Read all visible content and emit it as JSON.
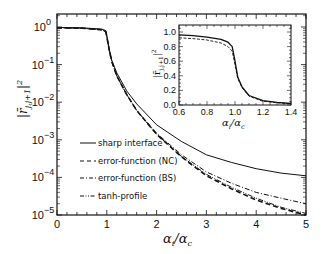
{
  "chart_data": [
    {
      "type": "line",
      "title": "",
      "xlabel": "αi/αc",
      "ylabel": "|r̄ j,j+1|²",
      "xscale": "linear",
      "yscale": "log",
      "xlim": [
        0,
        5
      ],
      "ylim": [
        1e-05,
        2
      ],
      "xticks": [
        "0",
        "1",
        "2",
        "3",
        "4",
        "5"
      ],
      "yticks": [
        "10^0",
        "10^-1",
        "10^-2",
        "10^-3",
        "10^-4",
        "10^-5"
      ],
      "grid": false,
      "legend_position": "lower left (inside)",
      "x": [
        0,
        0.5,
        0.9,
        0.98,
        1.0,
        1.05,
        1.1,
        1.2,
        1.4,
        1.6,
        2.0,
        2.5,
        3.0,
        3.5,
        4.0,
        4.5,
        5.0
      ],
      "series": [
        {
          "name": "sharp interface",
          "style": "solid",
          "values": [
            0.97,
            0.95,
            0.88,
            0.8,
            0.6,
            0.25,
            0.13,
            0.06,
            0.02,
            0.009,
            0.0025,
            0.0009,
            0.0004,
            0.00025,
            0.00017,
            0.00013,
            0.00011
          ]
        },
        {
          "name": "error-function (NC)",
          "style": "dashed",
          "values": [
            0.95,
            0.93,
            0.84,
            0.75,
            0.55,
            0.24,
            0.12,
            0.05,
            0.016,
            0.006,
            0.0014,
            0.00035,
            0.00011,
            5e-05,
            2.5e-05,
            1.5e-05,
            1e-05
          ]
        },
        {
          "name": "error-function (BS)",
          "style": "dash-dot",
          "values": [
            0.95,
            0.93,
            0.84,
            0.75,
            0.55,
            0.24,
            0.12,
            0.05,
            0.016,
            0.006,
            0.0015,
            0.0004,
            0.00014,
            7e-05,
            4e-05,
            2.8e-05,
            2e-05
          ]
        },
        {
          "name": "tanh-profile",
          "style": "dash-dot-dot",
          "values": [
            0.95,
            0.93,
            0.84,
            0.75,
            0.55,
            0.24,
            0.12,
            0.05,
            0.016,
            0.006,
            0.0014,
            0.00036,
            0.00012,
            5.5e-05,
            2.8e-05,
            1.6e-05,
            1.1e-05
          ]
        }
      ]
    },
    {
      "type": "line",
      "title": "inset",
      "xlabel": "αi/αc",
      "ylabel": "|r̄ j,j+1|²",
      "xscale": "linear",
      "yscale": "linear",
      "xlim": [
        0.6,
        1.4
      ],
      "ylim": [
        0.0,
        1.05
      ],
      "xticks": [
        "0.6",
        "0.8",
        "1.0",
        "1.2",
        "1.4"
      ],
      "yticks": [
        "0.0",
        "0.2",
        "0.4",
        "0.6",
        "0.8",
        "1.0"
      ],
      "x": [
        0.6,
        0.7,
        0.8,
        0.9,
        0.95,
        0.98,
        1.0,
        1.02,
        1.05,
        1.1,
        1.2,
        1.3,
        1.4
      ],
      "series": [
        {
          "name": "sharp interface",
          "style": "solid",
          "values": [
            0.96,
            0.95,
            0.93,
            0.9,
            0.86,
            0.8,
            0.6,
            0.38,
            0.25,
            0.13,
            0.06,
            0.035,
            0.02
          ]
        },
        {
          "name": "error-function",
          "style": "dashed",
          "values": [
            0.92,
            0.91,
            0.89,
            0.85,
            0.8,
            0.74,
            0.55,
            0.36,
            0.24,
            0.12,
            0.05,
            0.03,
            0.016
          ]
        }
      ]
    }
  ],
  "legend": [
    {
      "label": "sharp interface"
    },
    {
      "label": "error-function (NC)"
    },
    {
      "label": "error-function (BS)"
    },
    {
      "label": "tanh-profile"
    }
  ],
  "axes": {
    "xlabel_main": "α",
    "xlabel_sub_i": "i",
    "xlabel_slash": "/",
    "xlabel_den": "α",
    "xlabel_sub_c": "c",
    "ylabel_bar": "|r̄",
    "ylabel_sub": "j,j+1",
    "ylabel_tail": "|",
    "ylabel_sup": "2",
    "x_main_ticks": [
      "0",
      "1",
      "2",
      "3",
      "4",
      "5"
    ],
    "y_main_ticks": [
      "10",
      "10",
      "10",
      "10",
      "10",
      "10"
    ],
    "y_main_exps": [
      "0",
      "−1",
      "−2",
      "−3",
      "−4",
      "−5"
    ],
    "x_inset_ticks": [
      "0.6",
      "0.8",
      "1.0",
      "1.2",
      "1.4"
    ],
    "y_inset_ticks": [
      "0.0",
      "0.2",
      "0.4",
      "0.6",
      "0.8",
      "1.0"
    ]
  }
}
